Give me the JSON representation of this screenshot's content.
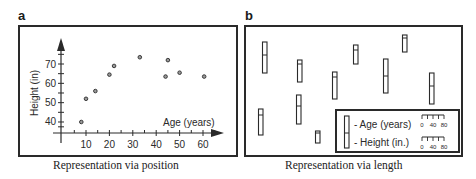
{
  "panels": {
    "a": {
      "letter": "a",
      "caption": "Representation via position"
    },
    "b": {
      "letter": "b",
      "caption": "Representation via length"
    }
  },
  "colors": {
    "ink": "#2a2a2a",
    "background": "#ffffff",
    "point_fill": "#9a9a9a"
  },
  "chart_data": [
    {
      "type": "scatter",
      "panel": "a",
      "title": "Representation via position",
      "xlabel": "Age (years)",
      "ylabel": "Height (in)",
      "xticks": [
        10,
        20,
        30,
        40,
        50,
        60
      ],
      "yticks": [
        40,
        50,
        60,
        70
      ],
      "xlim": [
        0,
        68
      ],
      "ylim": [
        35,
        78
      ],
      "grid": false,
      "points": [
        {
          "x": 8,
          "y": 40
        },
        {
          "x": 10,
          "y": 52
        },
        {
          "x": 14,
          "y": 56
        },
        {
          "x": 20,
          "y": 64.5
        },
        {
          "x": 22,
          "y": 69
        },
        {
          "x": 33,
          "y": 73.5
        },
        {
          "x": 44,
          "y": 63.5
        },
        {
          "x": 45,
          "y": 72
        },
        {
          "x": 50,
          "y": 65.5
        },
        {
          "x": 60.5,
          "y": 63.5
        }
      ]
    },
    {
      "type": "glyph",
      "panel": "b",
      "title": "Representation via length",
      "legend": {
        "items": [
          "- Age (years)",
          "- Height (in.)"
        ],
        "scale_ticks": [
          "0",
          "40",
          "80"
        ]
      },
      "glyphs_px": [
        {
          "x": 262,
          "top": 42,
          "divider": 55,
          "bottom": 73
        },
        {
          "x": 297,
          "top": 60,
          "divider": 64,
          "bottom": 82
        },
        {
          "x": 296,
          "top": 95,
          "divider": 106,
          "bottom": 124
        },
        {
          "x": 258,
          "top": 109,
          "divider": 115,
          "bottom": 135
        },
        {
          "x": 315,
          "top": 131,
          "divider": 133,
          "bottom": 143
        },
        {
          "x": 332,
          "top": 72,
          "divider": 77,
          "bottom": 99
        },
        {
          "x": 353,
          "top": 45,
          "divider": 50,
          "bottom": 64
        },
        {
          "x": 383,
          "top": 59,
          "divider": 76,
          "bottom": 93
        },
        {
          "x": 402,
          "top": 35,
          "divider": 38,
          "bottom": 52
        },
        {
          "x": 429,
          "top": 73,
          "divider": 86,
          "bottom": 104
        }
      ]
    }
  ]
}
